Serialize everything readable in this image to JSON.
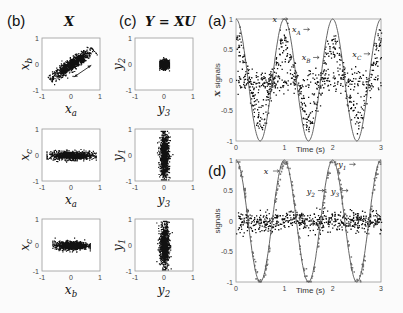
{
  "panels": {
    "b": {
      "label": "(b)",
      "title": "X"
    },
    "c": {
      "label": "(c)",
      "title": "Y = XU"
    },
    "a": {
      "label": "(a)"
    },
    "d": {
      "label": "(d)"
    }
  },
  "chart_data": [
    {
      "id": "b1",
      "type": "scatter",
      "panel": "(b)",
      "xlabel": "x_a",
      "ylabel": "x_b",
      "xlim": [
        -1,
        1
      ],
      "ylim": [
        -1,
        1
      ],
      "xticks": [
        "-1",
        "0",
        "1"
      ],
      "yticks": [
        "-1",
        "0",
        "1"
      ],
      "description": "elongated diagonal cloud along x_b = x_a, with double-headed arrow indicating spread direction",
      "cloud": {
        "cx": 0,
        "cy": 0,
        "sx": 0.55,
        "sy": 0.12,
        "angle_deg": 38
      }
    },
    {
      "id": "b2",
      "type": "scatter",
      "panel": "(b)",
      "xlabel": "x_a",
      "ylabel": "x_c",
      "xlim": [
        -1,
        1
      ],
      "ylim": [
        -1,
        1
      ],
      "xticks": [
        "-1",
        "0",
        "1"
      ],
      "yticks": [
        "-1",
        "0",
        "1"
      ],
      "cloud": {
        "cx": 0,
        "cy": 0,
        "sx": 0.5,
        "sy": 0.1,
        "angle_deg": 0
      }
    },
    {
      "id": "b3",
      "type": "scatter",
      "panel": "(b)",
      "xlabel": "x_b",
      "ylabel": "x_c",
      "xlim": [
        -1,
        1
      ],
      "ylim": [
        -1,
        1
      ],
      "xticks": [
        "-1",
        "0",
        "1"
      ],
      "yticks": [
        "-1",
        "0",
        "1"
      ],
      "cloud": {
        "cx": 0,
        "cy": 0,
        "sx": 0.38,
        "sy": 0.1,
        "angle_deg": 0
      }
    },
    {
      "id": "c1",
      "type": "scatter",
      "panel": "(c)",
      "xlabel": "y_3",
      "ylabel": "y_2",
      "xlim": [
        -1,
        1
      ],
      "ylim": [
        -1,
        1
      ],
      "xticks": [
        "-1",
        "0",
        "1"
      ],
      "yticks": [
        "-1",
        "0",
        "1"
      ],
      "cloud": {
        "cx": 0,
        "cy": 0,
        "sx": 0.1,
        "sy": 0.1,
        "angle_deg": 0
      }
    },
    {
      "id": "c2",
      "type": "scatter",
      "panel": "(c)",
      "xlabel": "y_3",
      "ylabel": "y_1",
      "xlim": [
        -1,
        1
      ],
      "ylim": [
        -1,
        1
      ],
      "xticks": [
        "-1",
        "0",
        "1"
      ],
      "yticks": [
        "-1",
        "0",
        "1"
      ],
      "cloud": {
        "cx": 0,
        "cy": 0,
        "sx": 0.1,
        "sy": 0.55,
        "angle_deg": 0
      }
    },
    {
      "id": "c3",
      "type": "scatter",
      "panel": "(c)",
      "xlabel": "y_2",
      "ylabel": "y_1",
      "xlim": [
        -1,
        1
      ],
      "ylim": [
        -1,
        1
      ],
      "xticks": [
        "-1",
        "0",
        "1"
      ],
      "yticks": [
        "-1",
        "0",
        "1"
      ],
      "cloud": {
        "cx": 0,
        "cy": 0,
        "sx": 0.1,
        "sy": 0.55,
        "angle_deg": 0
      }
    },
    {
      "id": "a",
      "type": "line",
      "panel": "(a)",
      "xlabel": "Time (s)",
      "ylabel": "X signals",
      "xlim": [
        0,
        3
      ],
      "ylim": [
        -1,
        1
      ],
      "xticks": [
        "0",
        "1",
        "2",
        "3"
      ],
      "yticks": [
        "-1",
        "-0.5",
        "0",
        "0.5",
        "1"
      ],
      "series": [
        {
          "name": "x",
          "style": "line",
          "function": "cos(2*pi*t)",
          "amplitude": 1
        },
        {
          "name": "x_A",
          "style": "markers",
          "amplitude": 0.6,
          "noise": 0.12
        },
        {
          "name": "x_B",
          "style": "markers",
          "amplitude": 0.6,
          "noise": 0.12
        },
        {
          "name": "x_C",
          "style": "markers",
          "amplitude": 0.0,
          "noise": 0.1
        }
      ],
      "annotations": [
        {
          "text": "x",
          "t": 0.8,
          "y": 0.95
        },
        {
          "text": "x_A",
          "t": 1.25,
          "y": 0.78
        },
        {
          "text": "x_B",
          "t": 1.45,
          "y": 0.32
        },
        {
          "text": "x_C",
          "t": 2.5,
          "y": 0.38
        }
      ]
    },
    {
      "id": "d",
      "type": "line",
      "panel": "(d)",
      "xlabel": "Time (s)",
      "ylabel": "signals",
      "xlim": [
        0,
        3
      ],
      "ylim": [
        -1,
        1
      ],
      "xticks": [
        "0",
        "1",
        "2",
        "3"
      ],
      "yticks": [
        "-1",
        "-0.5",
        "0",
        "0.5",
        "1"
      ],
      "series": [
        {
          "name": "x",
          "style": "line",
          "function": "cos(2*pi*t)",
          "amplitude": 1
        },
        {
          "name": "y_1",
          "style": "markers",
          "amplitude": 1.0,
          "noise": 0.05
        },
        {
          "name": "y_2",
          "style": "markers",
          "amplitude": 0.0,
          "noise": 0.08
        },
        {
          "name": "y_3",
          "style": "markers",
          "amplitude": 0.0,
          "noise": 0.08
        }
      ],
      "annotations": [
        {
          "text": "x",
          "t": 0.62,
          "y": 0.77
        },
        {
          "text": "y_1",
          "t": 2.2,
          "y": 0.88
        },
        {
          "text": "y_2",
          "t": 1.55,
          "y": 0.45
        },
        {
          "text": "y_3",
          "t": 2.05,
          "y": 0.45
        }
      ]
    }
  ]
}
